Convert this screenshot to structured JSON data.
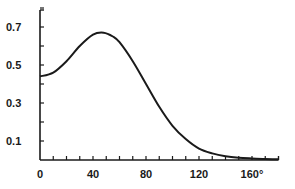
{
  "chart_data": {
    "type": "line",
    "title": "",
    "xlabel": "",
    "ylabel": "",
    "xlim": [
      0,
      180
    ],
    "ylim": [
      0,
      0.8
    ],
    "grid": false,
    "legend": null,
    "x_ticks": [
      {
        "value": 0,
        "label": "0"
      },
      {
        "value": 40,
        "label": "40"
      },
      {
        "value": 80,
        "label": "80"
      },
      {
        "value": 120,
        "label": "120"
      },
      {
        "value": 160,
        "label": "160°"
      }
    ],
    "x_minor_tick_step": 10,
    "y_ticks": [
      {
        "value": 0.1,
        "label": "0.1"
      },
      {
        "value": 0.3,
        "label": "0.3"
      },
      {
        "value": 0.5,
        "label": "0.5"
      },
      {
        "value": 0.7,
        "label": "0.7"
      }
    ],
    "y_minor_tick_step": 0.1,
    "series": [
      {
        "name": "curve",
        "color": "#1a1a1a",
        "x": [
          0,
          10,
          20,
          30,
          40,
          48,
          55,
          60,
          70,
          80,
          90,
          100,
          110,
          120,
          130,
          140,
          150,
          160,
          170,
          180
        ],
        "values": [
          0.44,
          0.46,
          0.52,
          0.6,
          0.66,
          0.67,
          0.65,
          0.62,
          0.52,
          0.4,
          0.28,
          0.18,
          0.11,
          0.06,
          0.035,
          0.02,
          0.012,
          0.008,
          0.005,
          0.004
        ]
      }
    ]
  }
}
